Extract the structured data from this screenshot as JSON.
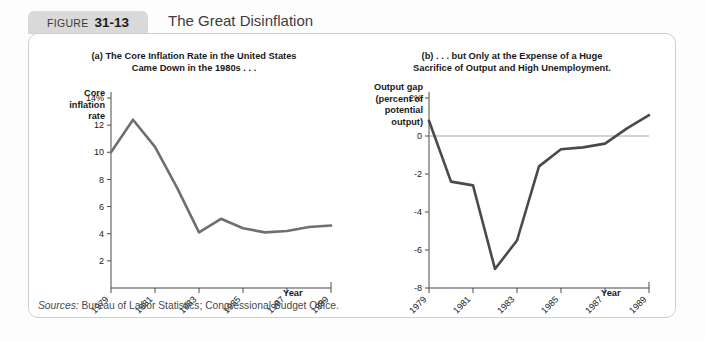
{
  "header": {
    "figure_word": "FIGURE",
    "figure_number": "31-13",
    "title": "The Great Disinflation"
  },
  "sources_label": "Sources:",
  "sources_text": " Bureau of Labor Statistics; Congressional Budget Office.",
  "panels": {
    "left": {
      "subtitle_line1": "(a) The Core Inflation Rate in the United States",
      "subtitle_line2": "Came Down in the 1980s . . .",
      "y_axis_title": "Core\ninflation\nrate",
      "x_axis_title": "Year"
    },
    "right": {
      "subtitle_line1": "(b) . . . but Only at the Expense of a Huge",
      "subtitle_line2": "Sacrifice of Output and High Unemployment.",
      "y_axis_title": "Output gap\n(percent of\npotential\noutput)",
      "x_axis_title": "Year"
    }
  },
  "chart_data": [
    {
      "type": "line",
      "title": "(a) The Core Inflation Rate in the United States Came Down in the 1980s . . .",
      "xlabel": "Year",
      "ylabel": "Core inflation rate",
      "x": [
        1979,
        1980,
        1981,
        1982,
        1983,
        1984,
        1985,
        1986,
        1987,
        1988,
        1989
      ],
      "values": [
        10.0,
        12.4,
        10.4,
        7.4,
        4.1,
        5.1,
        4.4,
        4.1,
        4.2,
        4.5,
        4.6
      ],
      "ylim": [
        0,
        14
      ],
      "yticks": [
        2,
        4,
        6,
        8,
        10,
        12,
        14
      ],
      "ytick_labels": [
        "2",
        "4",
        "6",
        "8",
        "10",
        "12",
        "14%"
      ],
      "xlim": [
        1979,
        1989
      ],
      "xticks": [
        1979,
        1981,
        1983,
        1985,
        1987,
        1989
      ],
      "xtick_labels": [
        "1979",
        "1981",
        "1983",
        "1985",
        "1987",
        "1989"
      ],
      "grid": false,
      "legend": "none",
      "line_color": "#6f6f6f"
    },
    {
      "type": "line",
      "title": "(b) . . . but Only at the Expense of a Huge Sacrifice of Output and High Unemployment.",
      "xlabel": "Year",
      "ylabel": "Output gap (percent of potential output)",
      "x": [
        1979,
        1980,
        1981,
        1982,
        1983,
        1984,
        1985,
        1986,
        1987,
        1988,
        1989
      ],
      "values": [
        0.8,
        -2.4,
        -2.6,
        -7.0,
        -5.5,
        -1.6,
        -0.7,
        -0.6,
        -0.4,
        0.4,
        1.1
      ],
      "ylim": [
        -8,
        2
      ],
      "yticks": [
        -8,
        -6,
        -4,
        -2,
        0,
        2
      ],
      "ytick_labels": [
        "-8",
        "-6",
        "-4",
        "-2",
        "0",
        "2%"
      ],
      "xlim": [
        1979,
        1989
      ],
      "xticks": [
        1979,
        1981,
        1983,
        1985,
        1987,
        1989
      ],
      "xtick_labels": [
        "1979",
        "1981",
        "1983",
        "1985",
        "1987",
        "1989"
      ],
      "grid": false,
      "zero_line": true,
      "legend": "none",
      "line_color": "#4a4a4a"
    }
  ]
}
